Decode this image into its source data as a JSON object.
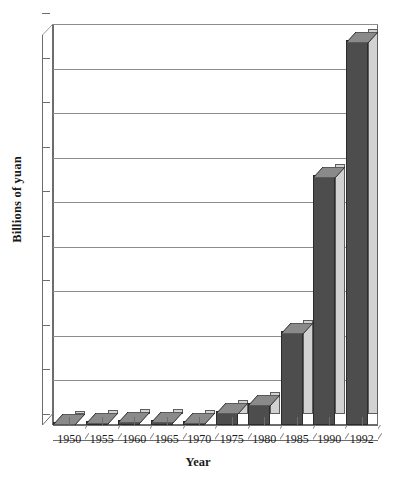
{
  "chart_data": {
    "type": "bar",
    "title": "",
    "xlabel": "Year",
    "ylabel": "Billions of yuan",
    "categories": [
      "1950",
      "1955",
      "1960",
      "1965",
      "1970",
      "1975",
      "1980",
      "1985",
      "1990",
      "1992"
    ],
    "values": [
      6,
      9,
      11,
      11,
      10,
      31,
      50,
      211,
      561,
      865
    ],
    "ylim": [
      0,
      900
    ],
    "ytick_labels": [
      "0",
      "100",
      "200",
      "300",
      "400",
      "500",
      "600",
      "700",
      "800",
      "900"
    ],
    "ytick_values": [
      0,
      100,
      200,
      300,
      400,
      500,
      600,
      700,
      800,
      900
    ],
    "grid": true,
    "legend": false,
    "style": "3d-column",
    "colors": {
      "bar_front": "#4d4d4d",
      "bar_side": "#d2d2d2",
      "bar_top": "#8a8a8a",
      "bar_edge": "#2b2b2b",
      "gridline": "#8d8d8d",
      "axis": "#6d6d6d",
      "background": "#ffffff",
      "text": "#1a1a1a"
    }
  },
  "axes": {
    "y_title": "Billions of yuan",
    "x_title": "Year"
  },
  "header": {
    "clipped_title": ""
  }
}
